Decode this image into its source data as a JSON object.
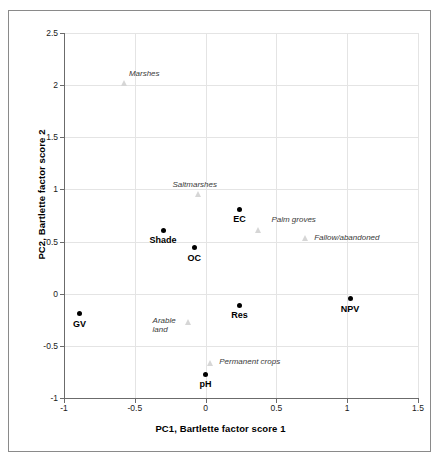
{
  "chart_data": {
    "type": "scatter",
    "title": "",
    "xlabel": "PC1, Bartlette factor score 1",
    "ylabel": "PC2, Bartlette factor score 2",
    "xlim": [
      -1,
      1.5
    ],
    "ylim": [
      -1,
      2.5
    ],
    "xticks": [
      "-1",
      "-0.5",
      "0",
      "0.5",
      "1",
      "1.5"
    ],
    "xtick_values": [
      -1,
      -0.5,
      0,
      0.5,
      1,
      1.5
    ],
    "yticks": [
      "-1",
      "-0.5",
      "0",
      "0.5",
      "1",
      "1.5",
      "2",
      "2.5"
    ],
    "ytick_values": [
      -1,
      -0.5,
      0,
      0.5,
      1,
      1.5,
      2,
      2.5
    ],
    "grid": true,
    "legend": "none",
    "series": [
      {
        "name": "variables",
        "marker": "filled-diamond",
        "label_style": "bold",
        "points": [
          {
            "label": "Shade",
            "x": -0.3,
            "y": 0.61
          },
          {
            "label": "OC",
            "x": -0.08,
            "y": 0.44
          },
          {
            "label": "EC",
            "x": 0.24,
            "y": 0.81
          },
          {
            "label": "GV",
            "x": -0.89,
            "y": -0.19
          },
          {
            "label": "Res",
            "x": 0.24,
            "y": -0.11
          },
          {
            "label": "NPV",
            "x": 1.02,
            "y": -0.05
          },
          {
            "label": "pH",
            "x": 0.0,
            "y": -0.77
          }
        ]
      },
      {
        "name": "land-use classes",
        "marker": "open-triangle",
        "label_style": "italic",
        "points": [
          {
            "label": "Marshes",
            "x": -0.57,
            "y": 2.02
          },
          {
            "label": "Saltmarshes",
            "x": -0.05,
            "y": 0.96
          },
          {
            "label": "Palm groves",
            "x": 0.38,
            "y": 0.61
          },
          {
            "label": "Fallow/abandoned",
            "x": 0.71,
            "y": 0.53
          },
          {
            "label": "Arable land",
            "x": -0.12,
            "y": -0.27
          },
          {
            "label": "Permanent crops",
            "x": 0.04,
            "y": -0.66
          }
        ]
      }
    ]
  }
}
